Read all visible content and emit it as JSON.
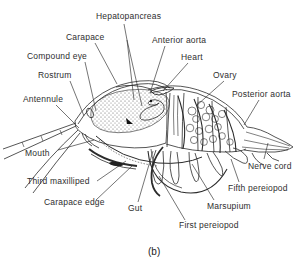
{
  "figure": {
    "caption": "(b)",
    "background_color": "#ffffff",
    "line_color": "#2b2b2b",
    "text_color": "#2e2e2e"
  },
  "labels": {
    "hepatopancreas": "Hepatopancreas",
    "carapace": "Carapace",
    "anterior_aorta": "Anterior aorta",
    "compound_eye": "Compound eye",
    "heart": "Heart",
    "rostrum": "Rostrum",
    "ovary": "Ovary",
    "antennule": "Antennule",
    "posterior_aorta": "Posterior aorta",
    "mouth": "Mouth",
    "third_maxilliped": "Third maxilliped",
    "carapace_edge": "Carapace edge",
    "gut": "Gut",
    "marsupium": "Marsupium",
    "fifth_pereiopod": "Fifth pereiopod",
    "nerve_cord": "Nerve cord",
    "first_pereiopod": "First pereiopod"
  }
}
